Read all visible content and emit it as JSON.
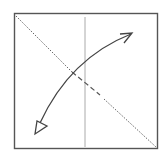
{
  "diagram": {
    "type": "origami-fold-step",
    "elements": {
      "paper": {
        "shape": "square",
        "stroke": "#555555"
      },
      "diagonal_fold_line": {
        "style": "dotted",
        "direction": "top-left to bottom-right",
        "stroke": "#666666"
      },
      "vertical_crease": {
        "style": "solid-thin",
        "stroke": "#aaaaaa"
      },
      "fold_arrow": {
        "style": "curved",
        "start_head": "open-triangle",
        "end_head": "open-chevron",
        "stroke": "#444444"
      }
    }
  }
}
